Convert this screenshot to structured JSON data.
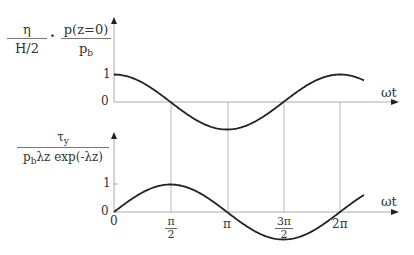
{
  "upper_plot": {
    "ylabel_left": {
      "num": "η",
      "den": "H/2"
    },
    "ylabel_sep": "·",
    "ylabel_right": {
      "num": "p(z=0)",
      "den_main": "p",
      "den_sub": "b"
    },
    "ytick_1": "1",
    "ytick_0": "0",
    "xlabel": "ωt",
    "curve": "cos(ωt)"
  },
  "lower_plot": {
    "ylabel": {
      "num_main": "τ",
      "num_sub": "y",
      "den_p": "p",
      "den_sub": "b",
      "den_rest": "λz exp(-λz)"
    },
    "ytick_1": "1",
    "ytick_0": "0",
    "xlabel": "ωt",
    "curve": "sin(ωt)",
    "xticks": [
      {
        "label": "0"
      },
      {
        "num": "π",
        "den": "2"
      },
      {
        "label": "π"
      },
      {
        "num": "3π",
        "den": "2"
      },
      {
        "label": "2π"
      }
    ]
  },
  "chart_data": [
    {
      "type": "line",
      "title": "",
      "xlabel": "ωt",
      "ylabel": "η/(H/2) · p(z=0)/p_b",
      "x": [
        0,
        0.785,
        1.571,
        2.356,
        3.142,
        3.927,
        4.712,
        5.498,
        6.283,
        6.8
      ],
      "series": [
        {
          "name": "η/(H/2), p(z=0)/p_b",
          "values": [
            1,
            0.707,
            0,
            -0.707,
            -1,
            -0.707,
            0,
            0.707,
            1,
            0.87
          ]
        }
      ],
      "xticks": [
        "0",
        "π/2",
        "π",
        "3π/2",
        "2π"
      ],
      "yticks": [
        "0",
        "1"
      ],
      "ylim": [
        -1.1,
        2.5
      ],
      "grid": "vertical lines at π/2, π, 3π/2, 2π"
    },
    {
      "type": "line",
      "title": "",
      "xlabel": "ωt",
      "ylabel": "τ_y / (p_b λz exp(-λz))",
      "x": [
        0,
        0.785,
        1.571,
        2.356,
        3.142,
        3.927,
        4.712,
        5.498,
        6.283,
        6.8
      ],
      "series": [
        {
          "name": "τ_y/(p_b λz exp(-λz))",
          "values": [
            0,
            0.707,
            1,
            0.707,
            0,
            -0.707,
            -1,
            -0.707,
            0,
            0.49
          ]
        }
      ],
      "xticks": [
        "0",
        "π/2",
        "π",
        "3π/2",
        "2π"
      ],
      "yticks": [
        "0",
        "1"
      ],
      "ylim": [
        -1.1,
        2.5
      ],
      "grid": "vertical lines at π/2, π, 3π/2, 2π"
    }
  ]
}
